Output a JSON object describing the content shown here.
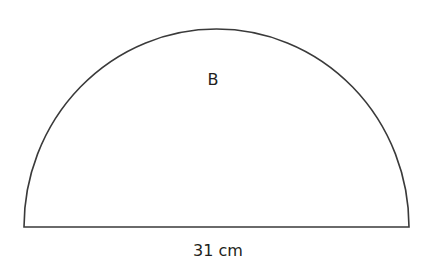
{
  "diagram": {
    "shape": "semicircle",
    "region_label": "B",
    "diameter_label": "31 cm",
    "colors": {
      "stroke": "#3a3a3a",
      "text": "#231f20",
      "background": "#ffffff"
    }
  }
}
